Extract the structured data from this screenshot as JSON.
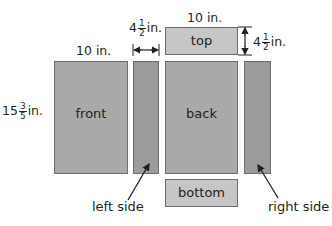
{
  "diagram": {
    "colors": {
      "panel_main": "#a9a9a9",
      "panel_side": "#9b9b9b",
      "panel_light": "#c6c6c6",
      "border": "#6d6d6d",
      "text": "#231f20"
    },
    "panels": {
      "front": {
        "label": "front"
      },
      "left_side": {
        "label": ""
      },
      "back": {
        "label": "back"
      },
      "right_side": {
        "label": ""
      },
      "top": {
        "label": "top"
      },
      "bottom": {
        "label": "bottom"
      }
    },
    "dimensions": {
      "front_width": "10 in.",
      "top_width": "10 in.",
      "front_height": {
        "whole": "15",
        "num": "3",
        "den": "5",
        "unit": "in."
      },
      "side_width": {
        "whole": "4",
        "num": "1",
        "den": "2",
        "unit": "in."
      },
      "top_height": {
        "whole": "4",
        "num": "1",
        "den": "2",
        "unit": "in."
      }
    },
    "callouts": {
      "left_side": "left side",
      "right_side": "right side"
    }
  }
}
